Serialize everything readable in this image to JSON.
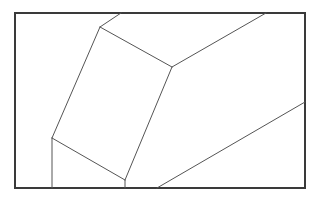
{
  "figure": {
    "width": 322,
    "height": 198,
    "background": "#ffffff",
    "frame": {
      "x": 15,
      "y": 13,
      "width": 290,
      "height": 175,
      "stroke": "#3a3a3a",
      "stroke_width": 2
    },
    "edge_style": {
      "stroke": "#555555",
      "stroke_width": 1
    },
    "vertices": {
      "A": [
        100,
        27
      ],
      "B": [
        172,
        67
      ],
      "C": [
        52,
        138
      ],
      "D": [
        125,
        180
      ]
    },
    "edges": [
      {
        "name": "edge-a-to-top",
        "from": [
          100,
          27
        ],
        "to": [
          121,
          13
        ]
      },
      {
        "name": "edge-b-to-top",
        "from": [
          172,
          67
        ],
        "to": [
          266,
          13
        ]
      },
      {
        "name": "edge-a-b",
        "from": [
          100,
          27
        ],
        "to": [
          172,
          67
        ]
      },
      {
        "name": "edge-a-c",
        "from": [
          100,
          27
        ],
        "to": [
          52,
          138
        ]
      },
      {
        "name": "edge-b-d",
        "from": [
          172,
          67
        ],
        "to": [
          125,
          180
        ]
      },
      {
        "name": "edge-c-d",
        "from": [
          52,
          138
        ],
        "to": [
          125,
          180
        ]
      },
      {
        "name": "edge-c-to-bottom",
        "from": [
          52,
          138
        ],
        "to": [
          52,
          188
        ]
      },
      {
        "name": "edge-d-to-bottom",
        "from": [
          125,
          180
        ],
        "to": [
          125,
          188
        ]
      },
      {
        "name": "edge-long-diagonal",
        "from": [
          157,
          188
        ],
        "to": [
          305,
          102
        ]
      }
    ]
  }
}
